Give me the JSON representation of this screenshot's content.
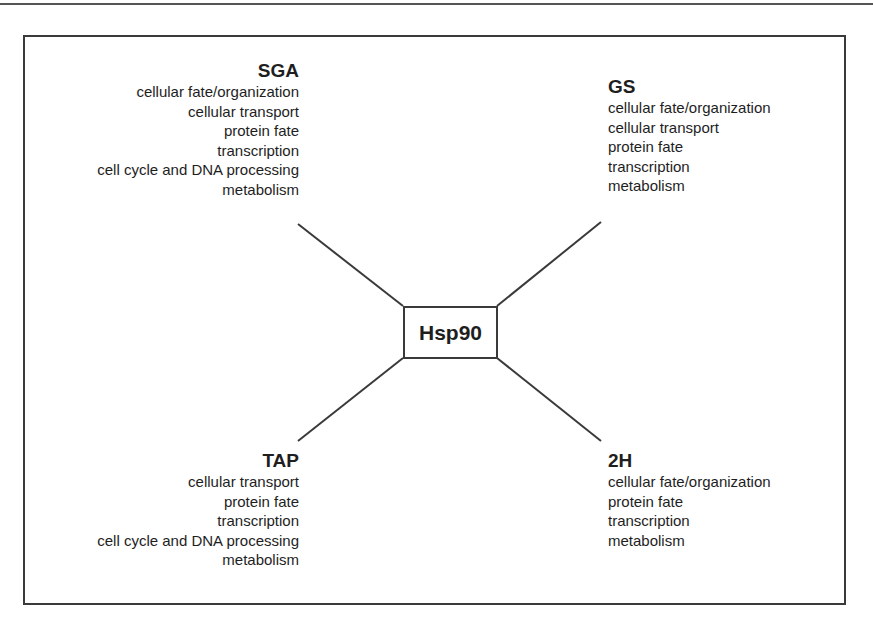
{
  "diagram": {
    "hub": {
      "label": "Hsp90"
    },
    "groups": {
      "sga": {
        "title": "SGA",
        "items": [
          "cellular fate/organization",
          "cellular transport",
          "protein fate",
          "transcription",
          "cell cycle and DNA processing",
          "metabolism"
        ]
      },
      "gs": {
        "title": "GS",
        "items": [
          "cellular fate/organization",
          "cellular transport",
          "protein fate",
          "transcription",
          "metabolism"
        ]
      },
      "tap": {
        "title": "TAP",
        "items": [
          "cellular transport",
          "protein fate",
          "transcription",
          "cell cycle and DNA processing",
          "metabolism"
        ]
      },
      "h2": {
        "title": "2H",
        "items": [
          "cellular fate/organization",
          "protein fate",
          "transcription",
          "metabolism"
        ]
      }
    },
    "colors": {
      "line": "#3a3a3a",
      "text": "#1e1e1e",
      "background": "#ffffff"
    }
  }
}
